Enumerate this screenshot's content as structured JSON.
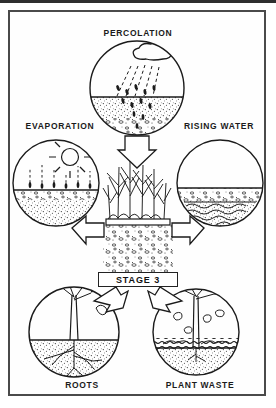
{
  "figure": {
    "type": "soil-water-cycle-diagram",
    "style": "black-and-white line-art scan",
    "center_label": "STAGE 3",
    "panels": [
      {
        "id": "percolation",
        "label": "PERCOLATION",
        "position": "top-center",
        "depicts": "cloud releasing rain that percolates down into stippled soil"
      },
      {
        "id": "evaporation",
        "label": "EVAPORATION",
        "position": "middle-left",
        "depicts": "sun with rays above soil, dashed lines rising as water vapor"
      },
      {
        "id": "rising-water",
        "label": "RISING WATER",
        "position": "middle-right",
        "depicts": "water table with wavy lines rising through gravelly soil"
      },
      {
        "id": "roots",
        "label": "ROOTS",
        "position": "bottom-left",
        "depicts": "leafy tree with branching root system spreading underground"
      },
      {
        "id": "plant-waste",
        "label": "PLANT WASTE",
        "position": "bottom-right",
        "depicts": "bare tree shedding leaves onto surface litter layer"
      }
    ],
    "center": {
      "id": "soil-column",
      "depicts": "grass and crop plants growing above a stippled soil/gravel column"
    },
    "arrows": [
      {
        "from": "percolation",
        "to": "soil-column",
        "direction": "down"
      },
      {
        "from": "evaporation",
        "to": "soil-column",
        "direction": "right"
      },
      {
        "from": "rising-water",
        "to": "soil-column",
        "direction": "left"
      },
      {
        "from": "roots",
        "to": "soil-column",
        "direction": "up-right"
      },
      {
        "from": "plant-waste",
        "to": "soil-column",
        "direction": "up-left"
      }
    ],
    "colors": {
      "ink": "#1b1b1b",
      "paper": "#fefefe",
      "frame": "#4a4a4a"
    }
  }
}
